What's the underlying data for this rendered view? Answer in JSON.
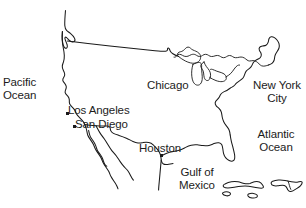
{
  "figure": {
    "kind": "line-drawing-map",
    "region": "United States and surrounding waters",
    "background_color": "#ffffff",
    "line_color": "#1a1a1a"
  },
  "labels": {
    "pacific_ocean": "Pacific\nOcean",
    "pacific_ocean_line1": "Pacific",
    "pacific_ocean_line2": "Ocean",
    "atlantic_ocean_line1": "Atlantic",
    "atlantic_ocean_line2": "Ocean",
    "gulf_of_mexico_line1": "Gulf of",
    "gulf_of_mexico_line2": "Mexico",
    "new_york_city_line1": "New York",
    "new_york_city_line2": "City",
    "los_angeles": "Los Angeles",
    "san_diego": "San Diego",
    "chicago": "Chicago",
    "houston": "Houston"
  },
  "cities": [
    {
      "name": "Los Angeles",
      "label": "Los Angeles",
      "marker": "dot"
    },
    {
      "name": "San Diego",
      "label": "San Diego",
      "marker": "dot"
    },
    {
      "name": "Chicago",
      "label": "Chicago",
      "marker": "none"
    },
    {
      "name": "Houston",
      "label": "Houston",
      "marker": "dot"
    },
    {
      "name": "New York City",
      "label": "New York City",
      "marker": "none"
    }
  ],
  "water_bodies": [
    {
      "name": "Pacific Ocean",
      "label": "Pacific Ocean"
    },
    {
      "name": "Atlantic Ocean",
      "label": "Atlantic Ocean"
    },
    {
      "name": "Gulf of Mexico",
      "label": "Gulf of Mexico"
    }
  ]
}
